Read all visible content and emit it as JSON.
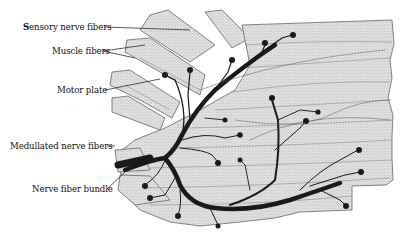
{
  "figure": {
    "labels": [
      {
        "id": "sensory",
        "text": "Sensory nerve fibers",
        "bold_initial": "S"
      },
      {
        "id": "muscle",
        "text": "Muscle fibers",
        "bold_initial": ""
      },
      {
        "id": "motor",
        "text": "Motor plate",
        "bold_initial": ""
      },
      {
        "id": "medullated",
        "text": "Medullated nerve fibers",
        "bold_initial": "Medullated"
      },
      {
        "id": "bundle",
        "text": "Nerve fiber bundle",
        "bold_initial": "Nerve fiber"
      }
    ]
  },
  "colors": {
    "background": "#ffffff",
    "muscle_fill": "#dcdcdc",
    "muscle_stroke": "#7a7a7a",
    "nerve": "#1a1a1a",
    "text": "#111111"
  }
}
